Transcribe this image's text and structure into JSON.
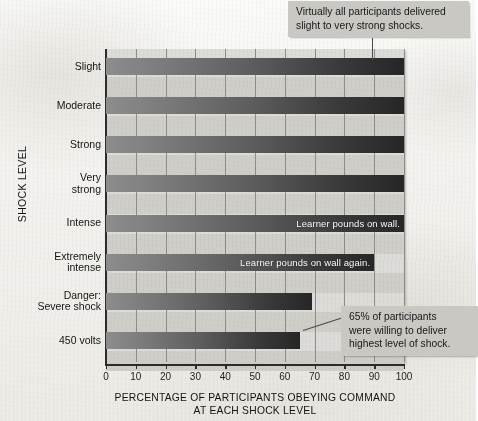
{
  "chart_data": {
    "type": "bar",
    "orientation": "horizontal",
    "title": "",
    "xlabel": "PERCENTAGE OF PARTICIPANTS OBEYING COMMAND AT EACH SHOCK LEVEL",
    "xlabel_line1": "PERCENTAGE OF PARTICIPANTS OBEYING COMMAND",
    "xlabel_line2": "AT EACH SHOCK LEVEL",
    "ylabel": "SHOCK LEVEL",
    "xlim": [
      0,
      100
    ],
    "xticks": [
      0,
      10,
      20,
      30,
      40,
      50,
      60,
      70,
      80,
      90,
      100
    ],
    "xtick_labels": [
      "0",
      "10",
      "20",
      "30",
      "40",
      "50",
      "60",
      "70",
      "80",
      "90",
      "100"
    ],
    "grid": true,
    "legend": "none",
    "categories": [
      "Slight",
      "Moderate",
      "Strong",
      "Very\nstrong",
      "Intense",
      "Extremely\nintense",
      "Danger:\nSevere shock",
      "450 volts"
    ],
    "values": [
      100,
      100,
      100,
      100,
      100,
      90,
      69,
      65
    ],
    "bars": [
      {
        "category": "Slight",
        "value": 100,
        "in_bar_label": ""
      },
      {
        "category": "Moderate",
        "value": 100,
        "in_bar_label": ""
      },
      {
        "category": "Strong",
        "value": 100,
        "in_bar_label": ""
      },
      {
        "category": "Very strong",
        "value": 100,
        "in_bar_label": ""
      },
      {
        "category": "Intense",
        "value": 100,
        "in_bar_label": "Learner pounds on wall."
      },
      {
        "category": "Extremely intense",
        "value": 90,
        "in_bar_label": "Learner pounds on wall again."
      },
      {
        "category": "Danger: Severe shock",
        "value": 69,
        "in_bar_label": ""
      },
      {
        "category": "450 volts",
        "value": 65,
        "in_bar_label": ""
      }
    ],
    "annotations": [
      {
        "id": "top-callout",
        "line1": "Virtually all participants delivered",
        "line2": "slight to very strong shocks.",
        "points_to": "100% bars"
      },
      {
        "id": "bottom-callout",
        "line1": "65% of participants",
        "line2": "were willing to deliver",
        "line3": "highest level of shock.",
        "points_to": "450 volts bar"
      }
    ],
    "colors": {
      "plot_background": "#dddcd8",
      "band_alt": "#cfcec9",
      "gridline": "#8e8d89",
      "axis": "#2c2c2c",
      "bar_gradient_start": "#8d8d8d",
      "bar_gradient_end": "#262626",
      "callout_background": "#c9c8c3",
      "text": "#141414",
      "in_bar_text": "#ffffff"
    }
  }
}
